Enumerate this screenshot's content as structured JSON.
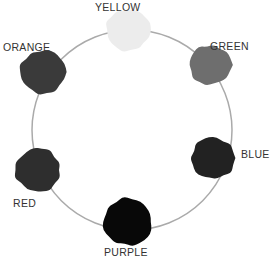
{
  "ring": {
    "cx": 132,
    "cy": 130,
    "r": 100,
    "stroke": "#aaaaaa"
  },
  "swatches": [
    {
      "name": "YELLOW",
      "cx": 128,
      "cy": 30,
      "r": 22,
      "fill": "#ececec",
      "label_x": 95,
      "label_y": 1
    },
    {
      "name": "GREEN",
      "cx": 210,
      "cy": 65,
      "r": 21,
      "fill": "#6e6e6e",
      "label_x": 210,
      "label_y": 40
    },
    {
      "name": "BLUE",
      "cx": 213,
      "cy": 158,
      "r": 22,
      "fill": "#222222",
      "label_x": 241,
      "label_y": 148
    },
    {
      "name": "PURPLE",
      "cx": 128,
      "cy": 222,
      "r": 25,
      "fill": "#080808",
      "label_x": 104,
      "label_y": 246
    },
    {
      "name": "RED",
      "cx": 38,
      "cy": 170,
      "r": 23,
      "fill": "#2e2e2e",
      "label_x": 13,
      "label_y": 197
    },
    {
      "name": "ORANGE",
      "cx": 43,
      "cy": 72,
      "r": 23,
      "fill": "#3a3a3a",
      "label_x": 3,
      "label_y": 41
    }
  ]
}
